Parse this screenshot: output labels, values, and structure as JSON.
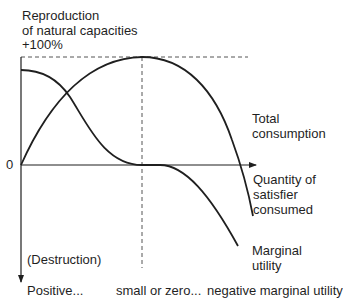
{
  "diagram": {
    "y_axis": {
      "title_line1": "Reproduction",
      "title_line2": "of natural capacities",
      "max_label": "+100%",
      "origin_label": "0",
      "negative_label": "(Destruction)"
    },
    "x_axis": {
      "label_line1": "Quantity of",
      "label_line2": "satisfier",
      "label_line3": "consumed"
    },
    "curves": {
      "total_line1": "Total",
      "total_line2": "consumption",
      "marginal_line1": "Marginal",
      "marginal_line2": "utility"
    },
    "phases": {
      "first": "Positive...",
      "second": "small or zero...",
      "third": "negative marginal utility"
    },
    "colors": {
      "line": "#1f1f1f",
      "dashed": "#555555",
      "background": "#ffffff"
    }
  }
}
